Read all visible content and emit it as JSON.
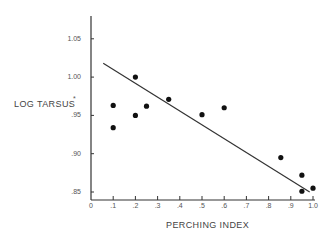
{
  "chart_data": {
    "type": "scatter",
    "title": "",
    "xlabel": "PERCHING INDEX",
    "ylabel": "LOG TARSUS",
    "ylabel_superscript": "*",
    "xlim": [
      0,
      1.0
    ],
    "ylim": [
      0.845,
      1.09
    ],
    "grid": false,
    "legend": null,
    "x_ticks": [
      0,
      0.1,
      0.2,
      0.3,
      0.4,
      0.5,
      0.6,
      0.7,
      0.8,
      0.9,
      1.0
    ],
    "x_tick_labels": [
      "0",
      ".1",
      ".2",
      ".3",
      ".4",
      ".5",
      ".6",
      ".7",
      ".8",
      ".9",
      "1.0"
    ],
    "y_ticks": [
      0.85,
      0.9,
      0.95,
      1.0,
      1.05
    ],
    "y_tick_labels": [
      ".85",
      ".90",
      ".95",
      "1.00",
      "1.05"
    ],
    "series": [
      {
        "name": "species",
        "type": "scatter",
        "points": [
          {
            "x": 0.1,
            "y": 0.963
          },
          {
            "x": 0.1,
            "y": 0.934
          },
          {
            "x": 0.2,
            "y": 1.0
          },
          {
            "x": 0.2,
            "y": 0.95
          },
          {
            "x": 0.25,
            "y": 0.962
          },
          {
            "x": 0.35,
            "y": 0.971
          },
          {
            "x": 0.5,
            "y": 0.951
          },
          {
            "x": 0.6,
            "y": 0.96
          },
          {
            "x": 0.855,
            "y": 0.895
          },
          {
            "x": 0.95,
            "y": 0.872
          },
          {
            "x": 0.95,
            "y": 0.851
          },
          {
            "x": 1.0,
            "y": 0.855
          }
        ]
      },
      {
        "name": "regression line",
        "type": "line",
        "points": [
          {
            "x": 0.055,
            "y": 1.018
          },
          {
            "x": 0.985,
            "y": 0.85
          }
        ]
      }
    ]
  },
  "colors": {
    "axis": "#333333",
    "points": "#111111",
    "line": "#333333",
    "text": "#555555"
  }
}
